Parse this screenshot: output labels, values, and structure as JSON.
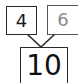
{
  "diagram": {
    "type": "number-bond",
    "parts": [
      {
        "value": "4",
        "color": "#1a1a1a"
      },
      {
        "value": "6",
        "color": "#8a8a8a"
      }
    ],
    "whole": {
      "value": "10"
    },
    "line_color": "#2a2a2a"
  }
}
